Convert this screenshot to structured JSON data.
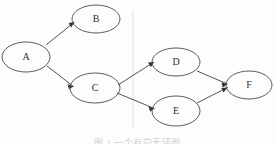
{
  "figure": {
    "type": "directed-graph",
    "caption": "图 1 一个有向无环图",
    "background_color": "#fdfdfd",
    "stroke_color": "#4a4a4a",
    "label_color": "#2e2e2e",
    "arrow_color": "#333333",
    "artifact_color": "#d8d8d8"
  },
  "nodes": [
    {
      "id": "A",
      "label": "A",
      "cx": 26,
      "cy": 57,
      "rx": 24,
      "ry": 15
    },
    {
      "id": "B",
      "label": "B",
      "cx": 96,
      "cy": 19,
      "rx": 24,
      "ry": 14
    },
    {
      "id": "C",
      "label": "C",
      "cx": 95,
      "cy": 88,
      "rx": 25,
      "ry": 15
    },
    {
      "id": "D",
      "label": "D",
      "cx": 176,
      "cy": 62,
      "rx": 24,
      "ry": 14
    },
    {
      "id": "E",
      "label": "E",
      "cx": 176,
      "cy": 111,
      "rx": 24,
      "ry": 15
    },
    {
      "id": "F",
      "label": "F",
      "cx": 249,
      "cy": 85,
      "rx": 23,
      "ry": 14
    }
  ],
  "edges": [
    {
      "from": "A",
      "to": "B",
      "x1": 46,
      "y1": 45,
      "x2": 73,
      "y2": 23
    },
    {
      "from": "A",
      "to": "C",
      "x1": 47,
      "y1": 66,
      "x2": 72,
      "y2": 85
    },
    {
      "from": "C",
      "to": "D",
      "x1": 118,
      "y1": 85,
      "x2": 153,
      "y2": 63
    },
    {
      "from": "C",
      "to": "E",
      "x1": 117,
      "y1": 93,
      "x2": 153,
      "y2": 108
    },
    {
      "from": "D",
      "to": "F",
      "x1": 197,
      "y1": 71,
      "x2": 227,
      "y2": 83
    },
    {
      "from": "E",
      "to": "F",
      "x1": 197,
      "y1": 103,
      "x2": 227,
      "y2": 88
    }
  ],
  "artifact": {
    "name": "vertical-scan-line",
    "x": 133,
    "y_top": 10,
    "y_bottom": 128
  }
}
